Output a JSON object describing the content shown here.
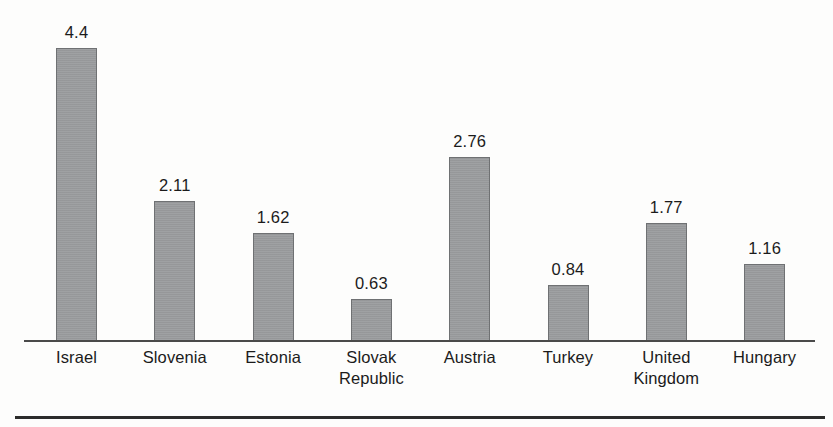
{
  "figure": {
    "background_color": "#fdfdfc",
    "bar_fill_color": "#9b9d9f",
    "bar_border_color": "#6f7173",
    "text_color": "#1b1b1b",
    "axis_color": "#4a4a4a",
    "rule_color": "#2b2b2b"
  },
  "chart_data": {
    "type": "bar",
    "title": "",
    "xlabel": "",
    "ylabel": "",
    "ylim": [
      0,
      4.4
    ],
    "grid": false,
    "legend": false,
    "axis_visible": {
      "x": true,
      "y": false
    },
    "value_labels_shown": true,
    "categories": [
      "Israel",
      "Slovenia",
      "Estonia",
      "Slovak Republic",
      "Austria",
      "Turkey",
      "United Kingdom",
      "Hungary"
    ],
    "values": [
      4.4,
      2.11,
      1.62,
      0.63,
      2.76,
      0.84,
      1.77,
      1.16
    ],
    "value_labels": [
      "4.4",
      "2.11",
      "1.62",
      "0.63",
      "2.76",
      "0.84",
      "1.77",
      "1.16"
    ],
    "bars": [
      {
        "category": "Israel",
        "label_lines": [
          "Israel"
        ],
        "value": 4.4,
        "value_label": "4.4"
      },
      {
        "category": "Slovenia",
        "label_lines": [
          "Slovenia"
        ],
        "value": 2.11,
        "value_label": "2.11"
      },
      {
        "category": "Estonia",
        "label_lines": [
          "Estonia"
        ],
        "value": 1.62,
        "value_label": "1.62"
      },
      {
        "category": "Slovak Republic",
        "label_lines": [
          "Slovak",
          "Republic"
        ],
        "value": 0.63,
        "value_label": "0.63"
      },
      {
        "category": "Austria",
        "label_lines": [
          "Austria"
        ],
        "value": 2.76,
        "value_label": "2.76"
      },
      {
        "category": "Turkey",
        "label_lines": [
          "Turkey"
        ],
        "value": 0.84,
        "value_label": "0.84"
      },
      {
        "category": "United Kingdom",
        "label_lines": [
          "United",
          "Kingdom"
        ],
        "value": 1.77,
        "value_label": "1.77"
      },
      {
        "category": "Hungary",
        "label_lines": [
          "Hungary"
        ],
        "value": 1.16,
        "value_label": "1.16"
      }
    ]
  }
}
